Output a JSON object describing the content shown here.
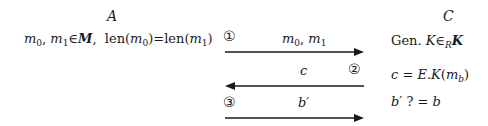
{
  "parties": {
    "left": {
      "label": "A"
    },
    "right": {
      "label": "C"
    }
  },
  "left_statement": {
    "m0": "m",
    "m0_sub": "0",
    "sep": ", ",
    "m1": "m",
    "m1_sub": "1",
    "in": "∈",
    "set": "M",
    "comma": ",",
    "len_a": "len(",
    "len_a_var": "m",
    "len_a_sub": "0",
    "len_a_close": ")",
    "eq": "=",
    "len_b": "len(",
    "len_b_var": "m",
    "len_b_sub": "1",
    "len_b_close": ")"
  },
  "messages": [
    {
      "step": "①",
      "direction": "right",
      "label_var1": "m",
      "label_sub1": "0",
      "label_sep": ", ",
      "label_var2": "m",
      "label_sub2": "1"
    },
    {
      "step": "②",
      "direction": "left",
      "label": "c"
    },
    {
      "step": "③",
      "direction": "right",
      "label": "b",
      "label_prime": "′"
    }
  ],
  "right_statements": {
    "gen": {
      "prefix": "Gen. ",
      "var": "K",
      "in": "∈",
      "sub": "R",
      "set": "K"
    },
    "enc": {
      "lhs": "c",
      "eq": " = ",
      "fn": "E",
      "dot": ".",
      "key": "K",
      "open": "(",
      "var": "m",
      "sub": "b",
      "close": ")"
    },
    "check": {
      "lhs": "b",
      "prime": "′",
      "q": " ? = ",
      "rhs": "b"
    }
  },
  "colors": {
    "ink": "#1a1a1a",
    "background": "#ffffff"
  }
}
